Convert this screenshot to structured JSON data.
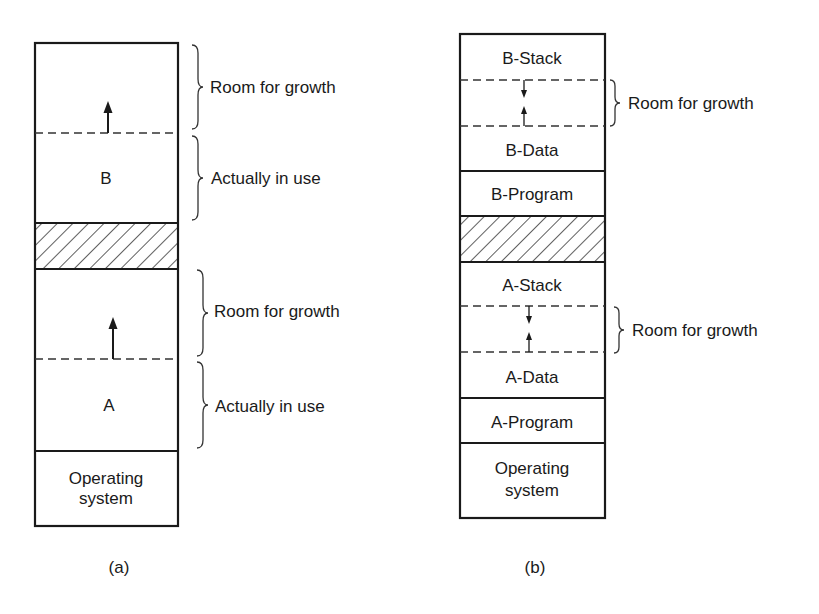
{
  "diagram_a": {
    "caption": "(a)",
    "box": {
      "x": 35,
      "y": 43,
      "w": 143,
      "h": 483
    },
    "segments": [
      {
        "id": "b-growth",
        "label": "",
        "y1": 43,
        "y2": 133,
        "kind": "growth"
      },
      {
        "id": "b-used",
        "label": "B",
        "y1": 133,
        "y2": 223,
        "kind": "used"
      },
      {
        "id": "hatched",
        "label": "",
        "y1": 223,
        "y2": 269,
        "kind": "hatched"
      },
      {
        "id": "a-growth",
        "label": "",
        "y1": 269,
        "y2": 359,
        "kind": "growth"
      },
      {
        "id": "a-used",
        "label": "A",
        "y1": 359,
        "y2": 451,
        "kind": "used"
      },
      {
        "id": "os",
        "label_line1": "Operating",
        "label_line2": "system",
        "y1": 451,
        "y2": 526,
        "kind": "os"
      }
    ],
    "annotations": [
      {
        "label": "Room for growth",
        "y1": 45,
        "y2": 130
      },
      {
        "label": "Actually in use",
        "y1": 136,
        "y2": 221
      },
      {
        "label": "Room for growth",
        "y1": 270,
        "y2": 355
      },
      {
        "label": "Actually in use",
        "y1": 362,
        "y2": 448
      }
    ],
    "arrows": [
      {
        "x": 108,
        "from": 133,
        "to": 103,
        "direction": "up"
      },
      {
        "x": 113,
        "from": 359,
        "to": 319,
        "direction": "up"
      }
    ]
  },
  "diagram_b": {
    "caption": "(b)",
    "box": {
      "x": 460,
      "y": 34,
      "w": 145,
      "h": 484
    },
    "segments": [
      {
        "id": "b-stack",
        "label": "B-Stack",
        "y1": 34,
        "y2": 80,
        "kind": "stack"
      },
      {
        "id": "b-gap",
        "label": "",
        "y1": 80,
        "y2": 126,
        "kind": "growth"
      },
      {
        "id": "b-data",
        "label": "B-Data",
        "y1": 126,
        "y2": 171,
        "kind": "data"
      },
      {
        "id": "b-program",
        "label": "B-Program",
        "y1": 171,
        "y2": 216,
        "kind": "program"
      },
      {
        "id": "hatched",
        "label": "",
        "y1": 216,
        "y2": 262,
        "kind": "hatched"
      },
      {
        "id": "a-stack",
        "label": "A-Stack",
        "y1": 262,
        "y2": 306,
        "kind": "stack"
      },
      {
        "id": "a-gap",
        "label": "",
        "y1": 306,
        "y2": 352,
        "kind": "growth"
      },
      {
        "id": "a-data",
        "label": "A-Data",
        "y1": 352,
        "y2": 398,
        "kind": "data"
      },
      {
        "id": "a-program",
        "label": "A-Program",
        "y1": 398,
        "y2": 443,
        "kind": "program"
      },
      {
        "id": "os",
        "label_line1": "Operating",
        "label_line2": "system",
        "y1": 443,
        "y2": 518,
        "kind": "os"
      }
    ],
    "annotations": [
      {
        "label": "Room for growth",
        "y1": 80,
        "y2": 126
      },
      {
        "label": "Room for growth",
        "y1": 307,
        "y2": 353
      }
    ],
    "arrows": [
      {
        "x": 524,
        "from": 80,
        "to": 96,
        "direction": "down"
      },
      {
        "x": 524,
        "from": 126,
        "to": 108,
        "direction": "up"
      },
      {
        "x": 529,
        "from": 306,
        "to": 322,
        "direction": "down"
      },
      {
        "x": 529,
        "from": 352,
        "to": 334,
        "direction": "up"
      }
    ]
  },
  "colors": {
    "line": "#1a1a1a",
    "background": "#ffffff"
  }
}
